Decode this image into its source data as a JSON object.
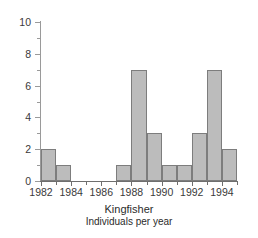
{
  "chart_data": {
    "type": "bar",
    "title": "Kingfisher",
    "subtitle": "Individuals per year",
    "xlabel": "",
    "ylabel": "",
    "categories": [
      1982,
      1983,
      1984,
      1985,
      1986,
      1987,
      1988,
      1989,
      1990,
      1991,
      1992,
      1993,
      1994
    ],
    "values": [
      2,
      1,
      0,
      0,
      0,
      1,
      7,
      3,
      1,
      1,
      3,
      7,
      2
    ],
    "xlim": [
      1982,
      1995
    ],
    "ylim": [
      0,
      10
    ],
    "y_major_ticks": [
      0,
      2,
      4,
      6,
      8,
      10
    ],
    "y_minor_ticks": [
      1,
      3,
      5,
      7,
      9
    ],
    "y_tick_labels": [
      "0",
      "2",
      "4",
      "6",
      "8",
      "10"
    ],
    "x_major_ticks": [
      1982,
      1984,
      1986,
      1988,
      1990,
      1992,
      1994
    ],
    "x_minor_ticks": [
      1983,
      1985,
      1987,
      1989,
      1991,
      1993,
      1995
    ],
    "x_tick_labels": [
      "1982",
      "1984",
      "1986",
      "1988",
      "1990",
      "1992",
      "1994"
    ],
    "grid": false,
    "legend": null,
    "bar_fill_color": "#bcbcbc",
    "bar_edge_color": "#7d7d7d",
    "axis_color": "#6e6e6e",
    "text_color": "#2b2b2b"
  }
}
